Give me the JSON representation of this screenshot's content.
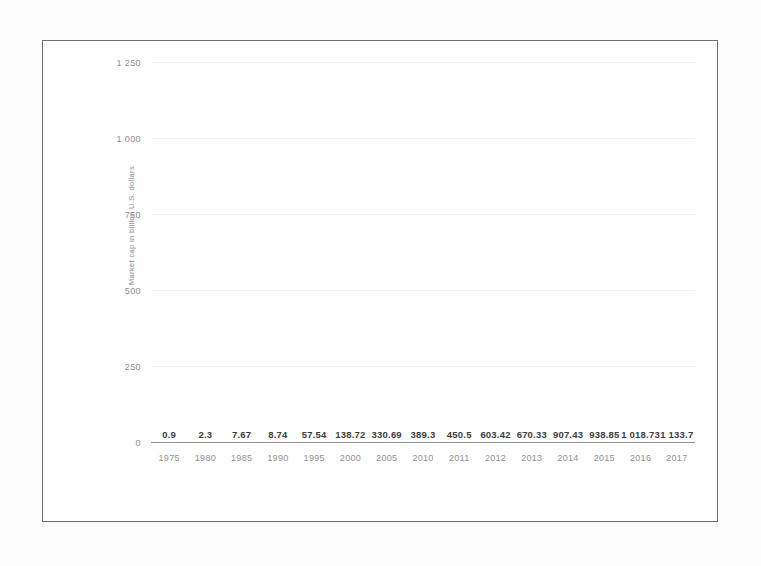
{
  "chart_data": {
    "type": "bar",
    "title": "",
    "xlabel": "",
    "ylabel": "Market cap in billion U.S. dollars",
    "categories": [
      "1975",
      "1980",
      "1985",
      "1990",
      "1995",
      "2000",
      "2005",
      "2010",
      "2011",
      "2012",
      "2013",
      "2014",
      "2015",
      "2016",
      "2017"
    ],
    "values": [
      0.9,
      2.3,
      7.67,
      8.74,
      57.54,
      138.72,
      330.69,
      389.3,
      450.5,
      603.42,
      670.33,
      907.43,
      938.85,
      1018.73,
      1133.7
    ],
    "value_labels": [
      "0.9",
      "2.3",
      "7.67",
      "8.74",
      "57.54",
      "138.72",
      "330.69",
      "389.3",
      "450.5",
      "603.42",
      "670.33",
      "907.43",
      "938.85",
      "1 018.73",
      "1 133.7"
    ],
    "ylim": [
      0,
      1250
    ],
    "ytick_values": [
      0,
      250,
      500,
      750,
      1000,
      1250
    ],
    "ytick_labels": [
      "0",
      "250",
      "500",
      "750",
      "1 000",
      "1 250"
    ],
    "grid": true,
    "legend": "none",
    "bar_color": "#4b4b4b",
    "grid_color": "#f0f0f0",
    "axis_text_color": "#8f8f8f",
    "label_text_color": "#3c3c3c",
    "frame_color": "#6d6d6d"
  }
}
